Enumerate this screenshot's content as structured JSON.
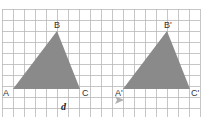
{
  "figure": {
    "grid": {
      "origin_x": 2,
      "origin_y": 9,
      "cell": 11,
      "cols": 18,
      "rows": 10,
      "line_color": "#b8b8b8",
      "bg": "#ffffff"
    },
    "triangle_original": {
      "fill": "#8a8a8a",
      "vertices": [
        {
          "label": "A",
          "x": 13,
          "y": 89
        },
        {
          "label": "B",
          "x": 57,
          "y": 31
        },
        {
          "label": "C",
          "x": 80,
          "y": 89
        }
      ]
    },
    "triangle_image": {
      "fill": "#8a8a8a",
      "vertices": [
        {
          "label": "A'",
          "x": 123,
          "y": 89
        },
        {
          "label": "B'",
          "x": 167,
          "y": 31
        },
        {
          "label": "C'",
          "x": 190,
          "y": 89
        }
      ]
    },
    "vector": {
      "label": "d",
      "arrow_color": "#b0b0b0"
    }
  }
}
